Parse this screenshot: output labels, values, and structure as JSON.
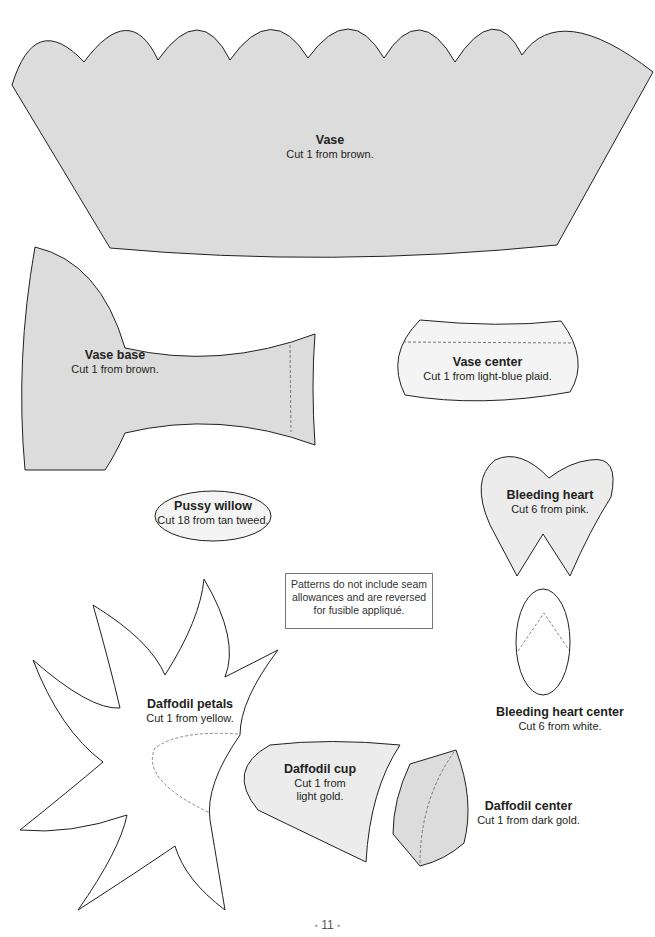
{
  "patterns": {
    "vase": {
      "title": "Vase",
      "instruction": "Cut 1 from brown."
    },
    "vase_base": {
      "title": "Vase base",
      "instruction": "Cut 1 from brown."
    },
    "vase_center": {
      "title": "Vase center",
      "instruction": "Cut 1 from light-blue plaid."
    },
    "pussy_willow": {
      "title": "Pussy willow",
      "instruction": "Cut 18 from tan tweed."
    },
    "bleeding_heart": {
      "title": "Bleeding heart",
      "instruction": "Cut 6 from pink."
    },
    "bleeding_heart_center": {
      "title": "Bleeding heart center",
      "instruction": "Cut 6 from white."
    },
    "daffodil_petals": {
      "title": "Daffodil petals",
      "instruction": "Cut 1 from yellow."
    },
    "daffodil_cup": {
      "title": "Daffodil cup",
      "instruction_line1": "Cut 1 from",
      "instruction_line2": "light gold."
    },
    "daffodil_center": {
      "title": "Daffodil center",
      "instruction": "Cut 1 from dark gold."
    }
  },
  "note": {
    "line1": "Patterns do not include seam",
    "line2": "allowances and are reversed",
    "line3": "for fusible appliqué."
  },
  "page": {
    "number": "11",
    "separator": "•"
  },
  "colors": {
    "shaded_fill": "#dcdcdc",
    "outline": "#231f20",
    "dash": "#777777"
  }
}
